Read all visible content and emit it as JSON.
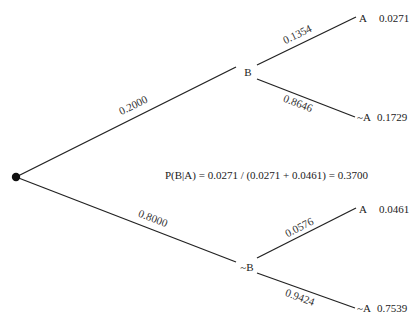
{
  "diagram": {
    "type": "probability-tree",
    "root": {
      "x": 16,
      "y": 177
    },
    "first_level": [
      {
        "id": "B",
        "label": "B",
        "edge_probability": "0.2000",
        "node": {
          "x": 248,
          "y": 72
        },
        "children": [
          {
            "id": "B-A",
            "label": "A",
            "edge_probability": "0.1354",
            "joint_probability": "0.0271"
          },
          {
            "id": "B-notA",
            "label": "~A",
            "edge_probability": "0.8646",
            "joint_probability": "0.1729"
          }
        ]
      },
      {
        "id": "notB",
        "label": "~B",
        "edge_probability": "0.8000",
        "node": {
          "x": 247,
          "y": 267
        },
        "children": [
          {
            "id": "notB-A",
            "label": "A",
            "edge_probability": "0.0576",
            "joint_probability": "0.0461"
          },
          {
            "id": "notB-notA",
            "label": "~A",
            "edge_probability": "0.9424",
            "joint_probability": "0.7539"
          }
        ]
      }
    ],
    "formula": "P(B|A) = 0.0271 / (0.0271 + 0.0461) = 0.3700",
    "colors": {
      "line": "#222222",
      "text": "#222222",
      "root_dot": "#111111",
      "background": "#ffffff"
    }
  }
}
